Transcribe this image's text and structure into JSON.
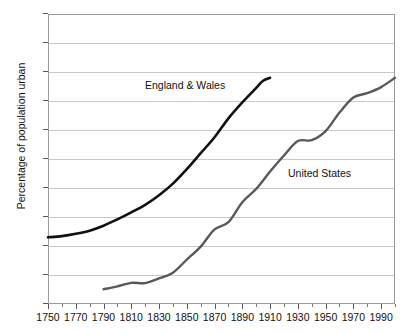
{
  "chart_data": {
    "type": "line",
    "title": "",
    "subtitle": "",
    "xlabel": "",
    "ylabel": "Percentage of population urban",
    "xlim": [
      1750,
      2000
    ],
    "ylim": [
      0,
      100
    ],
    "grid": true,
    "legend_position": "inline-annotations",
    "y_ticks": [
      0,
      10,
      20,
      30,
      40,
      50,
      60,
      70,
      80,
      90,
      100
    ],
    "y_tick_labels": [
      "0",
      "10",
      "20",
      "30",
      "40",
      "50",
      "60",
      "70",
      "80",
      "90",
      "100"
    ],
    "x_ticks": [
      1750,
      1770,
      1790,
      1810,
      1830,
      1850,
      1870,
      1890,
      1910,
      1930,
      1950,
      1970,
      1990
    ],
    "x_tick_labels": [
      "1750",
      "1770",
      "1790",
      "1810",
      "1830",
      "1850",
      "1870",
      "1890",
      "1910",
      "1930",
      "1950",
      "1970",
      "1990"
    ],
    "x_minor_tick_step": 10,
    "series": [
      {
        "name": "England & Wales",
        "color": "#111111",
        "line_width": 2.6,
        "annotation": "England & Wales",
        "x": [
          1750,
          1760,
          1770,
          1780,
          1790,
          1800,
          1810,
          1820,
          1830,
          1840,
          1850,
          1860,
          1870,
          1880,
          1890,
          1900,
          1905,
          1910
        ],
        "values": [
          23,
          23.4,
          24.2,
          25.3,
          27,
          29.2,
          31.6,
          34.2,
          37.5,
          41.5,
          46.5,
          52,
          57.5,
          64,
          69.5,
          74.5,
          77,
          78
        ]
      },
      {
        "name": "United States",
        "color": "#595959",
        "line_width": 2.4,
        "annotation": "United States",
        "x": [
          1790,
          1800,
          1810,
          1820,
          1830,
          1840,
          1850,
          1860,
          1870,
          1880,
          1890,
          1900,
          1910,
          1920,
          1930,
          1940,
          1950,
          1960,
          1970,
          1980,
          1990,
          2000
        ],
        "values": [
          5.1,
          6.1,
          7.3,
          7.2,
          8.8,
          10.8,
          15.3,
          19.8,
          25.7,
          28.2,
          35.1,
          39.7,
          45.7,
          51.2,
          56.2,
          56.5,
          59.6,
          66,
          71.2,
          72.7,
          74.8,
          78
        ]
      }
    ]
  },
  "annotations": {
    "england_label": "England & Wales",
    "us_label": "United States"
  }
}
